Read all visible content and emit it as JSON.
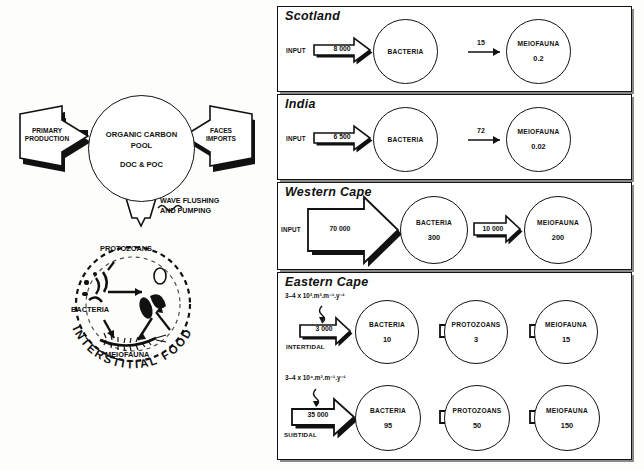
{
  "figure": {
    "left_diagram": {
      "pool": {
        "title_line1": "ORGANIC CARBON",
        "title_line2": "POOL",
        "subtitle": "DOC & POC"
      },
      "input_arrows": [
        {
          "name": "primary-production",
          "line1": "PRIMARY",
          "line2": "PRODUCTION"
        },
        {
          "name": "faces-imports",
          "line1": "FACES",
          "line2": "IMPORTS"
        }
      ],
      "wave_arrow": {
        "line1": "WAVE FLUSHING",
        "line2": "AND PUMPING"
      },
      "food_chain": {
        "ring_text": "INTERSTITIAL FOOD CHAIN",
        "members": [
          "PROTOZOANS",
          "BACTERIA",
          "MEIOFAUNA"
        ]
      }
    },
    "panels": [
      {
        "title": "Scotland",
        "input_label": "INPUT",
        "input_value": "8 000",
        "arrow_style": "small",
        "nodes": [
          {
            "name": "BACTERIA",
            "value": ""
          },
          {
            "name": "MEIOFAUNA",
            "value": "0.2"
          }
        ],
        "link_value": "15",
        "link_style": "thin"
      },
      {
        "title": "India",
        "input_label": "INPUT",
        "input_value": "6 500",
        "arrow_style": "small",
        "nodes": [
          {
            "name": "BACTERIA",
            "value": ""
          },
          {
            "name": "MEIOFAUNA",
            "value": "0.02"
          }
        ],
        "link_value": "72",
        "link_style": "thin"
      },
      {
        "title": "Western Cape",
        "input_label": "INPUT",
        "input_value": "70 000",
        "arrow_style": "large",
        "nodes": [
          {
            "name": "BACTERIA",
            "value": "300"
          },
          {
            "name": "MEIOFAUNA",
            "value": "200"
          }
        ],
        "link_value": "10 000",
        "link_style": "block"
      },
      {
        "title": "Eastern Cape",
        "rows": [
          {
            "annotation": "3–4 x 10³.m³.m⁻¹.y⁻¹",
            "input_value": "3 000",
            "tide_label": "INTERTIDAL",
            "nodes": [
              {
                "name": "BACTERIA",
                "value": "10"
              },
              {
                "name": "PROTOZOANS",
                "value": "3"
              },
              {
                "name": "MEIOFAUNA",
                "value": "15"
              }
            ]
          },
          {
            "annotation": "3–4 x 10⁴.m³.m⁻¹.y⁻¹",
            "input_value": "35 000",
            "tide_label": "SUBTIDAL",
            "nodes": [
              {
                "name": "BACTERIA",
                "value": "95"
              },
              {
                "name": "PROTOZOANS",
                "value": "50"
              },
              {
                "name": "MEIOFAUNA",
                "value": "150"
              }
            ]
          }
        ]
      }
    ]
  },
  "colors": {
    "ink": "#111111",
    "paper": "#fdfdfb",
    "shadow": "#8a8a8a"
  }
}
